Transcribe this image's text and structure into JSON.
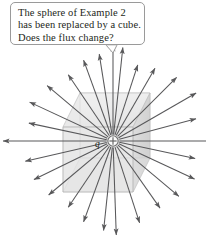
{
  "figure": {
    "width": 206,
    "height": 236,
    "background": "#ffffff",
    "caption_box": {
      "lines": [
        "The sphere of Example 2",
        "has been replaced by a cube.",
        "Does the flux change?"
      ],
      "border_color": "#9a9a9a",
      "text_color": "#231f20"
    },
    "charge": {
      "label": "q",
      "sign": "+",
      "center_x": 113,
      "center_y": 141,
      "radius": 5.2,
      "marker_color": "#6f6f6f"
    },
    "cube": {
      "name": "gaussian-cube",
      "fill_front": "#e4e4e4",
      "fill_top": "#efefef",
      "fill_side": "#d8d8d8",
      "edge_color": "#b6b6b6",
      "front_face": [
        [
          63,
          127
        ],
        [
          133,
          127
        ],
        [
          133,
          192
        ],
        [
          63,
          192
        ]
      ],
      "back_face": [
        [
          80,
          93
        ],
        [
          150,
          93
        ],
        [
          150,
          158
        ],
        [
          80,
          158
        ]
      ]
    },
    "field": {
      "name": "radial-electric-field",
      "line_color": "#58585a",
      "arrow_count": 24,
      "direction": "outward",
      "description": "Radial electric field lines emanating outward from the positive point charge at the cube center."
    },
    "field_lines": [
      {
        "angle": 0,
        "length": 112
      },
      {
        "angle": 15,
        "length": 86
      },
      {
        "angle": 30,
        "length": 96
      },
      {
        "angle": 45,
        "length": 90
      },
      {
        "angle": 60,
        "length": 84
      },
      {
        "angle": 72,
        "length": 80
      },
      {
        "angle": 84,
        "length": 94
      },
      {
        "angle": 90,
        "length": 96
      },
      {
        "angle": 99,
        "length": 88
      },
      {
        "angle": 110,
        "length": 86
      },
      {
        "angle": 124,
        "length": 80
      },
      {
        "angle": 140,
        "length": 86
      },
      {
        "angle": 155,
        "length": 92
      },
      {
        "angle": 168,
        "length": 86
      },
      {
        "angle": 180,
        "length": 110
      },
      {
        "angle": 193,
        "length": 90
      },
      {
        "angle": 206,
        "length": 88
      },
      {
        "angle": 220,
        "length": 84
      },
      {
        "angle": 236,
        "length": 80
      },
      {
        "angle": 250,
        "length": 86
      },
      {
        "angle": 264,
        "length": 90
      },
      {
        "angle": 272,
        "length": 94
      },
      {
        "angle": 288,
        "length": 86
      },
      {
        "angle": 305,
        "length": 82
      },
      {
        "angle": 320,
        "length": 86
      },
      {
        "angle": 335,
        "length": 90
      },
      {
        "angle": 348,
        "length": 84
      }
    ]
  }
}
